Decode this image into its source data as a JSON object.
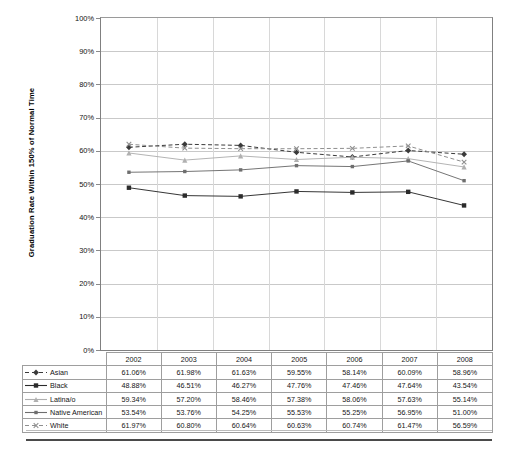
{
  "chart_data": {
    "type": "line",
    "title": "",
    "xlabel": "",
    "ylabel": "Graduation Rate Within 150% of Normal Time",
    "ylim": [
      0,
      100
    ],
    "ytick_labels": [
      "100%",
      "90%",
      "80%",
      "70%",
      "60%",
      "50%",
      "40%",
      "30%",
      "20%",
      "10%",
      "0%"
    ],
    "ytick_values": [
      100,
      90,
      80,
      70,
      60,
      50,
      40,
      30,
      20,
      10,
      0
    ],
    "grid": true,
    "legend_position": "table-below",
    "categories": [
      "2002",
      "2003",
      "2004",
      "2005",
      "2006",
      "2007",
      "2008"
    ],
    "series": [
      {
        "name": "Asian",
        "marker": "diamond",
        "line_style": "dashed",
        "color": "#3a3a3a",
        "values": [
          61.06,
          61.98,
          61.63,
          59.55,
          58.14,
          60.09,
          58.96
        ],
        "labels": [
          "61.06%",
          "61.98%",
          "61.63%",
          "59.55%",
          "58.14%",
          "60.09%",
          "58.96%"
        ]
      },
      {
        "name": "Black",
        "marker": "square-filled",
        "line_style": "solid",
        "color": "#2b2b2b",
        "values": [
          48.88,
          46.51,
          46.27,
          47.76,
          47.46,
          47.64,
          43.54
        ],
        "labels": [
          "48.88%",
          "46.51%",
          "46.27%",
          "47.76%",
          "47.46%",
          "47.64%",
          "43.54%"
        ]
      },
      {
        "name": "Latina/o",
        "marker": "triangle",
        "line_style": "solid",
        "color": "#b0b0b0",
        "values": [
          59.34,
          57.2,
          58.46,
          57.38,
          58.06,
          57.63,
          55.14
        ],
        "labels": [
          "59.34%",
          "57.20%",
          "58.46%",
          "57.38%",
          "58.06%",
          "57.63%",
          "55.14%"
        ]
      },
      {
        "name": "Native American",
        "marker": "square",
        "line_style": "solid",
        "color": "#6e6e6e",
        "values": [
          53.54,
          53.76,
          54.25,
          55.53,
          55.25,
          56.95,
          51.0
        ],
        "labels": [
          "53.54%",
          "53.76%",
          "54.25%",
          "55.53%",
          "55.25%",
          "56.95%",
          "51.00%"
        ]
      },
      {
        "name": "White",
        "marker": "x",
        "line_style": "dashed",
        "color": "#8f8f8f",
        "values": [
          61.97,
          60.8,
          60.64,
          60.63,
          60.74,
          61.47,
          56.59
        ],
        "labels": [
          "61.97%",
          "60.80%",
          "60.64%",
          "60.63%",
          "60.74%",
          "61.47%",
          "56.59%"
        ]
      }
    ]
  }
}
